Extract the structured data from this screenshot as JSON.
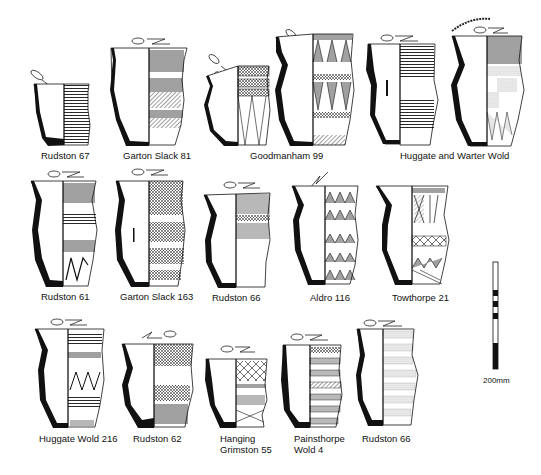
{
  "figure": {
    "type": "archaeological pottery drawings",
    "scale_bar": {
      "label": "200mm",
      "segments": 8
    }
  },
  "vessels": [
    {
      "id": 0,
      "label": "Rudston  67",
      "symbols": [
        "female",
        "grave-goods"
      ],
      "row": 1
    },
    {
      "id": 1,
      "label": "Garton Slack 81",
      "symbols": [
        "grave-goods"
      ],
      "row": 1
    },
    {
      "id": 2,
      "label": "",
      "symbols": [
        "female",
        "grave-goods"
      ],
      "row": 1
    },
    {
      "id": 3,
      "label": "Goodmanham 99",
      "symbols": [
        "grave-goods"
      ],
      "row": 1
    },
    {
      "id": 4,
      "label": "",
      "symbols": [
        "grave-goods"
      ],
      "row": 1
    },
    {
      "id": 5,
      "label": "Huggate and Warter Wold",
      "symbols": [
        "grave-goods",
        "arc"
      ],
      "row": 1
    },
    {
      "id": 6,
      "label": "Rudston  61",
      "symbols": [
        "female",
        "grave-goods"
      ],
      "row": 2
    },
    {
      "id": 7,
      "label": "Garton Slack 163",
      "symbols": [
        "female",
        "grave-goods"
      ],
      "row": 2
    },
    {
      "id": 8,
      "label": "Rudston  66",
      "symbols": [
        "grave-goods"
      ],
      "row": 2
    },
    {
      "id": 9,
      "label": "Aldro 116",
      "symbols": [
        "grave-goods"
      ],
      "row": 2
    },
    {
      "id": 10,
      "label": "Towthorpe 21",
      "symbols": [
        "female"
      ],
      "row": 2
    },
    {
      "id": 11,
      "label": "Huggate Wold 216",
      "symbols": [
        "grave-goods"
      ],
      "row": 3
    },
    {
      "id": 12,
      "label": "Rudston  62",
      "symbols": [
        "female",
        "grave-goods"
      ],
      "row": 3
    },
    {
      "id": 13,
      "label_lines": [
        "Hanging",
        "Grimston 55"
      ],
      "symbols": [
        "female",
        "grave-goods"
      ],
      "row": 3
    },
    {
      "id": 14,
      "label_lines": [
        "Painsthorpe",
        "Wold 4"
      ],
      "symbols": [
        "female",
        "grave-goods"
      ],
      "row": 3
    },
    {
      "id": 15,
      "label": "Rudston  66",
      "symbols": [
        "grave-goods"
      ],
      "row": 3
    }
  ],
  "labels": {
    "rudston67": "Rudston  67",
    "garton81": "Garton Slack 81",
    "goodmanham99": "Goodmanham 99",
    "huggate_warter": "Huggate and Warter Wold",
    "rudston61": "Rudston  61",
    "garton163": "Garton Slack 163",
    "rudston66a": "Rudston  66",
    "aldro116": "Aldro 116",
    "towthorpe21": "Towthorpe 21",
    "huggate216": "Huggate Wold 216",
    "rudston62": "Rudston  62",
    "hanging1": "Hanging",
    "hanging2": "Grimston 55",
    "painsthorpe1": "Painsthorpe",
    "painsthorpe2": "Wold 4",
    "rudston66b": "Rudston  66",
    "scale": "200mm"
  }
}
